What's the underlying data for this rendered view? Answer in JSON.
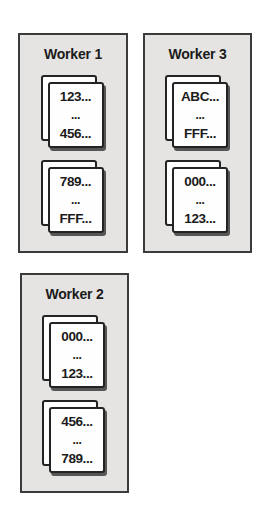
{
  "workers": [
    {
      "title": "Worker 1",
      "stacks": [
        {
          "lines": [
            "123...",
            "...",
            "456..."
          ]
        },
        {
          "lines": [
            "789...",
            "...",
            "FFF..."
          ]
        }
      ]
    },
    {
      "title": "Worker 3",
      "stacks": [
        {
          "lines": [
            "ABC...",
            "...",
            "FFF..."
          ]
        },
        {
          "lines": [
            "000...",
            "...",
            "123..."
          ]
        }
      ]
    },
    {
      "title": "Worker 2",
      "stacks": [
        {
          "lines": [
            "000...",
            "...",
            "123..."
          ]
        },
        {
          "lines": [
            "456...",
            "...",
            "789..."
          ]
        }
      ]
    }
  ],
  "colors": {
    "page_bg": "#ffffff",
    "box_fill": "#e5e4e2",
    "box_border": "#3b3b3b",
    "card_fill": "#fefefe",
    "card_border": "#232323",
    "card_shadow": "#565656",
    "text": "#1b1b1b"
  }
}
